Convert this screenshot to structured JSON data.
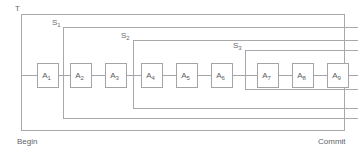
{
  "diagram": {
    "title_label": "T",
    "begin_label": "Begin",
    "commit_label": "Commit",
    "stroke_color": "#a3a3a8",
    "background_color": "#ffffff",
    "frames": [
      {
        "id": "T",
        "name": "T",
        "base": "T",
        "subscript": "",
        "x": 21,
        "y": 14,
        "width": 323,
        "height": 116,
        "label_x": 15,
        "label_y": 11
      },
      {
        "id": "S1",
        "name": "S1",
        "base": "S",
        "subscript": "1",
        "x": 63,
        "y": 27,
        "width": 295,
        "height": 91,
        "label_x": 52,
        "label_y": 25
      },
      {
        "id": "S2",
        "name": "S2",
        "base": "S",
        "subscript": "2",
        "x": 133,
        "y": 40,
        "width": 225,
        "height": 68,
        "label_x": 121,
        "label_y": 38
      },
      {
        "id": "S3",
        "name": "S3",
        "base": "S",
        "subscript": "3",
        "x": 245,
        "y": 50,
        "width": 113,
        "height": 39,
        "label_x": 233,
        "label_y": 48
      }
    ],
    "actions": [
      {
        "id": "A1",
        "base": "A",
        "subscript": "1",
        "x": 37,
        "y": 63,
        "width": 21,
        "height": 24
      },
      {
        "id": "A2",
        "base": "A",
        "subscript": "2",
        "x": 70,
        "y": 63,
        "width": 21,
        "height": 24
      },
      {
        "id": "A3",
        "base": "A",
        "subscript": "3",
        "x": 105,
        "y": 63,
        "width": 21,
        "height": 24
      },
      {
        "id": "A4",
        "base": "A",
        "subscript": "4",
        "x": 141,
        "y": 63,
        "width": 21,
        "height": 24
      },
      {
        "id": "A5",
        "base": "A",
        "subscript": "5",
        "x": 176,
        "y": 63,
        "width": 21,
        "height": 24
      },
      {
        "id": "A6",
        "base": "A",
        "subscript": "6",
        "x": 211,
        "y": 63,
        "width": 21,
        "height": 24
      },
      {
        "id": "A7",
        "base": "A",
        "subscript": "7",
        "x": 257,
        "y": 63,
        "width": 21,
        "height": 24
      },
      {
        "id": "A8",
        "base": "A",
        "subscript": "8",
        "x": 292,
        "y": 63,
        "width": 21,
        "height": 24
      },
      {
        "id": "A9",
        "base": "A",
        "subscript": "9",
        "x": 327,
        "y": 63,
        "width": 21,
        "height": 24
      }
    ],
    "spine": {
      "y": 75,
      "x_start": 21,
      "x_end": 358
    },
    "begin_label_x": 17,
    "begin_label_y": 144,
    "commit_label_x": 318,
    "commit_label_y": 144
  }
}
